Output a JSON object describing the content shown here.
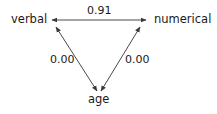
{
  "diagram": {
    "type": "correlation-path-diagram",
    "nodes": [
      {
        "id": "verbal",
        "label": "verbal"
      },
      {
        "id": "numerical",
        "label": "numerical"
      },
      {
        "id": "age",
        "label": "age"
      }
    ],
    "edges": [
      {
        "from": "verbal",
        "to": "numerical",
        "label": "0.91",
        "direction": "bidirectional"
      },
      {
        "from": "verbal",
        "to": "age",
        "label": "0.00",
        "direction": "bidirectional"
      },
      {
        "from": "numerical",
        "to": "age",
        "label": "0.00",
        "direction": "bidirectional"
      }
    ],
    "colors": {
      "line": "#4a4a4a",
      "text": "#1a1a1a",
      "background": "#ffffff"
    }
  }
}
